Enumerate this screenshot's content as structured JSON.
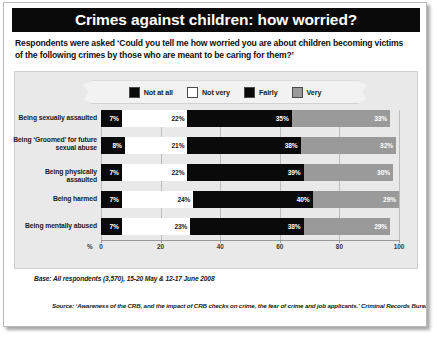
{
  "title": "Crimes against children: how worried?",
  "subtitle_line1": "Respondents were asked ‘Could you tell me how worried you are about children becoming victims",
  "subtitle_line2": "of the following crimes by those who are meant to be caring for them?’",
  "legend": [
    {
      "label": "Not at all",
      "color": "#0a0a0a"
    },
    {
      "label": "Not very",
      "color": "#ffffff"
    },
    {
      "label": "Fairly",
      "color": "#0a0a0a"
    },
    {
      "label": "Very",
      "color": "#9a9a9a"
    }
  ],
  "base_note": "Base: All respondents (3,570), 15-20 May & 12-17 June 2008",
  "source_note": "Source: ‘Awareness of the CRB, and the impact of CRB checks on crime, the fear of crime and job applicants.’ Criminal Records Bureau, Ipsos MORI",
  "chart_data": {
    "type": "bar",
    "orientation": "horizontal",
    "stacked": true,
    "title": "Crimes against children: how worried?",
    "xlabel": "%",
    "ylabel": "",
    "xlim": [
      0,
      100
    ],
    "xticks": [
      "0",
      "20",
      "40",
      "60",
      "80",
      "100"
    ],
    "grid": true,
    "legend_position": "top",
    "categories": [
      "Being sexually assaulted",
      "Being ‘Groomed’ for future sexual abuse",
      "Being physically assaulted",
      "Being harmed",
      "Being mentally abused"
    ],
    "category_lines": [
      [
        "Being sexually assaulted"
      ],
      [
        "Being ‘Groomed’ for future",
        "sexual abuse"
      ],
      [
        "Being physically assaulted"
      ],
      [
        "Being harmed"
      ],
      [
        "Being mentally abused"
      ]
    ],
    "series": [
      {
        "name": "Not at all",
        "color": "#0a0a0a",
        "values": [
          7,
          8,
          7,
          7,
          7
        ]
      },
      {
        "name": "Not very",
        "color": "#ffffff",
        "values": [
          22,
          21,
          22,
          24,
          23
        ]
      },
      {
        "name": "Fairly",
        "color": "#0a0a0a",
        "values": [
          35,
          38,
          39,
          40,
          38
        ]
      },
      {
        "name": "Very",
        "color": "#9a9a9a",
        "values": [
          33,
          32,
          30,
          29,
          29
        ]
      }
    ],
    "data_labels": [
      [
        "7%",
        "22%",
        "35%",
        "33%"
      ],
      [
        "8%",
        "21%",
        "38%",
        "32%"
      ],
      [
        "7%",
        "22%",
        "39%",
        "30%"
      ],
      [
        "7%",
        "24%",
        "40%",
        "29%"
      ],
      [
        "7%",
        "23%",
        "38%",
        "29%"
      ]
    ]
  }
}
